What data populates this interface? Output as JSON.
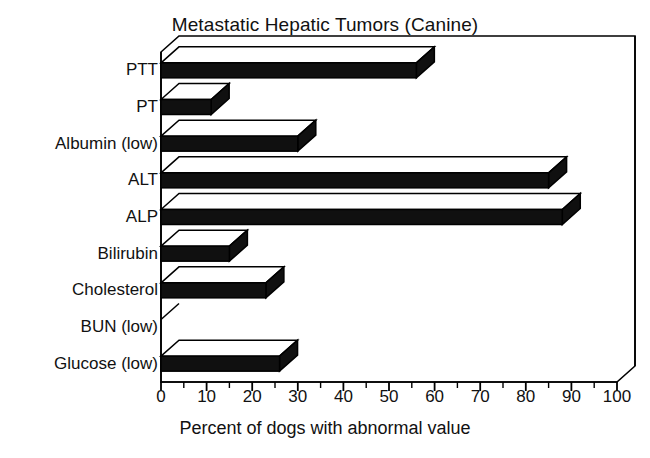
{
  "chart_data": {
    "type": "bar",
    "orientation": "horizontal",
    "style": "3d-bar",
    "title": "Metastatic Hepatic Tumors (Canine)",
    "xlabel": "Percent of dogs with abnormal value",
    "ylabel": "",
    "xlim": [
      0,
      100
    ],
    "xticks": [
      0,
      10,
      20,
      30,
      40,
      50,
      60,
      70,
      80,
      90,
      100
    ],
    "xtick_labels": [
      "0",
      "10",
      "20",
      "30",
      "40",
      "50",
      "60",
      "70",
      "80",
      "90",
      "100"
    ],
    "minor_tick_step": 5,
    "grid": false,
    "legend": "none",
    "bar_color": "#101010",
    "bar_top_color": "#ffffff",
    "bar_edge_color": "#000000",
    "categories": [
      "PTT",
      "PT",
      "Albumin (low)",
      "ALT",
      "ALP",
      "Bilirubin",
      "Cholesterol",
      "BUN (low)",
      "Glucose (low)"
    ],
    "values": [
      56,
      11,
      30,
      85,
      88,
      15,
      23,
      0,
      26
    ],
    "series": [
      {
        "name": "Percent of dogs with abnormal value",
        "values": [
          56,
          11,
          30,
          85,
          88,
          15,
          23,
          0,
          26
        ]
      }
    ]
  },
  "figure": {
    "title": "Metastatic Hepatic Tumors (Canine)",
    "x_axis_title": "Percent of dogs with abnormal value",
    "page_artifact": "(Canine)"
  }
}
